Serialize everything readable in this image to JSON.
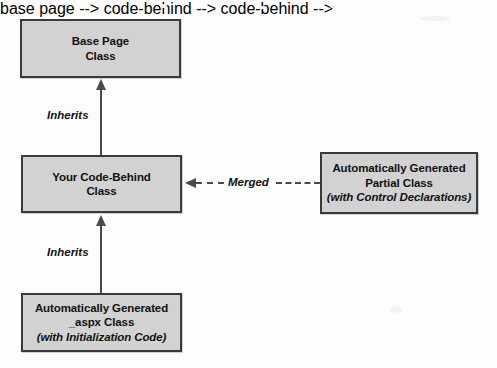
{
  "diagram": {
    "background_color": "#fdfdfd",
    "node_fill_color": "#d2d2d2",
    "node_border_color": "#3a3a3a",
    "connector_color": "#4a4a4a",
    "nodes": [
      {
        "id": "base-page",
        "lines": [
          {
            "text": "Base Page",
            "italic": false
          },
          {
            "text": "Class",
            "italic": false
          }
        ]
      },
      {
        "id": "code-behind",
        "lines": [
          {
            "text": "Your Code-Behind",
            "italic": false
          },
          {
            "text": "Class",
            "italic": false
          }
        ]
      },
      {
        "id": "aspx",
        "lines": [
          {
            "text": "Automatically Generated",
            "italic": false
          },
          {
            "text": "_aspx Class",
            "italic": false
          },
          {
            "text": "(with Initialization Code)",
            "italic": true
          }
        ]
      },
      {
        "id": "partial",
        "lines": [
          {
            "text": "Automatically Generated",
            "italic": false
          },
          {
            "text": "Partial Class",
            "italic": false
          },
          {
            "text": "(with Control Declarations)",
            "italic": true
          }
        ]
      }
    ],
    "edges": [
      {
        "id": "inherits-top",
        "label": "Inherits",
        "style": "solid",
        "direction": "up"
      },
      {
        "id": "inherits-bottom",
        "label": "Inherits",
        "style": "solid",
        "direction": "up"
      },
      {
        "id": "merged",
        "label": "Merged",
        "style": "dashed",
        "direction": "left"
      }
    ]
  }
}
